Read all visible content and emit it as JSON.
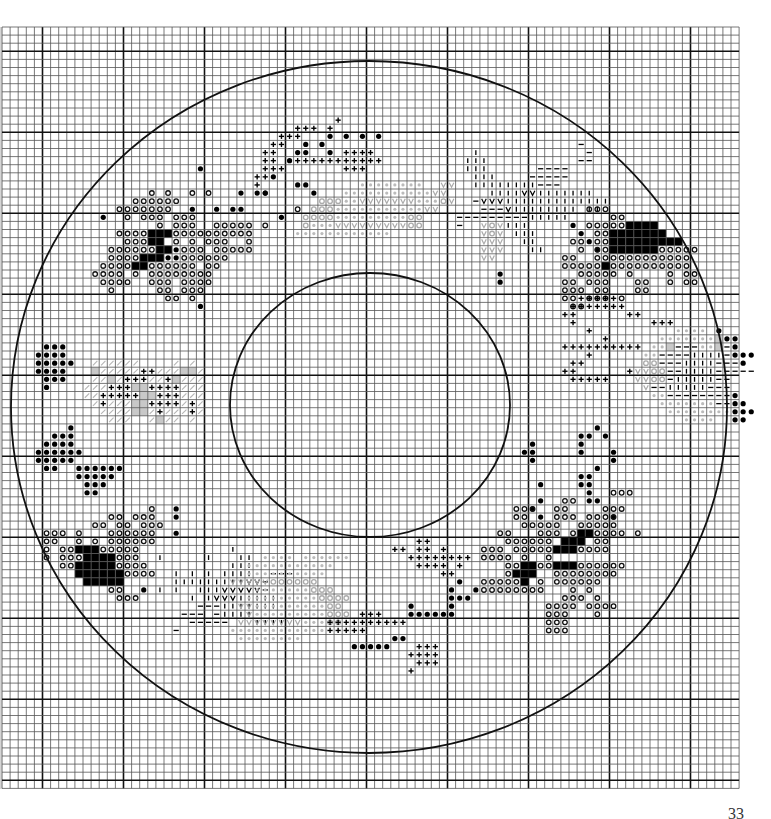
{
  "page": {
    "number": "33",
    "background": "#ffffff"
  },
  "grid": {
    "origin_x": 2,
    "origin_y": 27,
    "cell": 8.1,
    "cols": 91,
    "rows": 94,
    "heavy_every": 10,
    "heavy_offset_col": 4.5,
    "heavy_offset_row": 3,
    "line_color": "#555555",
    "heavy_color": "#111111"
  },
  "circles": {
    "outer": {
      "cx": 369,
      "cy": 407,
      "rx": 358,
      "ry": 346
    },
    "inner": {
      "cx": 370,
      "cy": 405,
      "rx": 140,
      "ry": 132
    }
  },
  "legend_symbols": {
    "o": "ring",
    "X": "solid",
    "b": "dot-large",
    ".": "dot-small",
    "+": "cross",
    "I": "bar-vertical",
    "-": "bar-horizontal",
    "V": "v-mark",
    "g": "grey-ring",
    "v": "grey-v",
    "s": "grey-slash",
    "k": "grey-dot",
    "q": "grey-fill"
  },
  "motifs": [
    {
      "name": "top-left-flower",
      "col": 10,
      "row": 17,
      "rows": [
        "..............b.................",
        ".......................b........",
        "..........................bb....",
        "........o.o..o.o...b.bb.....b...",
        "......oooooo.....................",
        "....ooooooo..b..b.bb......o.....",
        "..b..o.ooo.ooo..........b.......",
        ".........o.ooo..ooooo.o..........",
        "....ooooXXXoooooooooo...........",
        ".....oooXX.o.o.ooo..o...........",
        "...ooooooXXbooo.ooooo...........",
        "...ooooXXXbboooooo..............",
        "..ooooXXoooooo.oo...............",
        ".oooo.o.oooooooo................",
        "..oooo..ooo.oooo................",
        "...o.....oo.ooo.................",
        "..........oo.o..................",
        "..............b................."
      ]
    },
    {
      "name": "top-crosses",
      "col": 30,
      "row": 11,
      "rows": [
        "...........+.........",
        "......+++.+..........",
        "....+++...b.b.b.b....",
        "...++..b.b...........",
        "..++..bb..b.++++.....",
        "..++.b+++++++++++....",
        "..+++.......+++......",
        ".++..................",
        ".+...................",
        "..b.................."
      ]
    },
    {
      "name": "top-right-bars",
      "col": 56,
      "row": 14,
      "rows": [
        "...............-....",
        "..I.............-...",
        ".III...........--...",
        ".III......----......",
        "..III....-----.......",
        "..IIIIIIII---........",
        "....IIIIVVIIIIIII....",
        "..-VVVIIIIIIIIIIIII..",
        "...---VIIIIIIII.II...",
        "---------IIIII.......",
        "-.....III.....b......",
        ".......III.....b.....",
        "........II......b....",
        ".........II......b..."
      ]
    },
    {
      "name": "right-flower",
      "col": 69,
      "row": 22,
      "rows": [
        "...ooo............",
        "......oo..........",
        "...oooooXXXX......",
        "....ooXXXXXXX.....",
        ".oo.ooXXXXXXXXX...",
        "..o.ooXXXXXXooooo.",
        "oo..oooooooooooo..",
        "oooooXoooooooooo..",
        "..ooooo.o....o.oo.",
        "oo.ooo...oo..o.oo.",
        "ooo.oo...oo.......",
        "oo.ooo.o..........",
        ".oo..............."
      ]
    },
    {
      "name": "right-crosses",
      "col": 68,
      "row": 33,
      "rows": [
        "...+++++.......",
        "..+++++++......",
        ".++......++....",
        "..+.........+++",
        "....+..........",
        "......+........",
        ".++++++++++....",
        "....+..........",
        "..++...........",
        ".++......+.....",
        "..+++++........"
      ]
    },
    {
      "name": "right-grey-heart",
      "col": 77,
      "row": 37,
      "rows": [
        "......kkkk.b...",
        "....kkkkkkkqbb.",
        "...kkq---kkq-b.",
        "..kk----IIII-bbb",
        "..gg---IIII---b.",
        ".vvgg--IIII-----",
        ".vvgg-IIIII--...",
        "..v--IIIII---...",
        "...kk--------b..",
        "....kkkkkkk--bb.",
        ".....kkkkkkkkbbb",
        ".......kkkk..bb."
      ]
    },
    {
      "name": "lower-right-dots",
      "col": 62,
      "row": 49,
      "rows": [
        "...........b.....",
        ".........bb.b....",
        "...b.....b.......",
        "..bb.....b...b...",
        "...b.........b...",
        "...........b.....",
        ".........bb......",
        "....b....bb......",
        "..........b......",
        "....b.....bb.....",
        "...b.............",
        "....b........b..."
      ]
    },
    {
      "name": "lower-right-flower",
      "col": 59,
      "row": 57,
      "rows": [
        "................ooo",
        "..........oo......",
        "....ooo..oo....ooo..",
        "....oo...ooo.oooo...",
        ".....ooooo..ooooo...",
        "..oo...ooo.oXXoooo.o",
        "...oooooo.XXX.oo....",
        "ooo.oooooXXXoooo....",
        "oooo.o..o.........",
        "...ooXXooXXXoooooo..",
        "...oXXX..oooooooo...",
        "oooooX.o.oooooo.....",
        "oooooooo...o.o......",
        "..........ooo.o.....",
        "........oooo.oooo...",
        "........ooo...o.....",
        "........ooo.........",
        "........ooo........."
      ]
    },
    {
      "name": "left-heart-grey",
      "col": 9,
      "row": 41,
      "rows": [
        "..ssssss....s.s..",
        "..qsssss++sssqqs.",
        "..ssqs+++ss+qsss.",
        ".sss+++qq++++sss.",
        ".ss+++++qq+++sss.",
        "..s+sssqq++++s+s.",
        "...ssssqqs+sss+s.",
        "....sss..sqss.s.."
      ]
    },
    {
      "name": "left-dots",
      "col": 4,
      "row": 39,
      "rows": [
        ".bbb.......",
        "bbbb.......",
        "bbbbb......",
        "bbbb.......",
        ".bbb.......",
        ".b.........",
        "...........",
        "...........",
        "...........",
        "...........",
        "....b......",
        "..bbb......",
        ".bbbb......",
        "bbbbbb.....",
        "bbbbb......",
        ".bb..bbbbbb",
        ".....bbbbb.",
        "......bbb..",
        "......bb..."
      ]
    },
    {
      "name": "bottom-left-flower",
      "col": 5,
      "row": 59,
      "rows": [
        ".............o..b",
        "........oo.ooo..b",
        "......oo.oo.ooo..",
        "ooo.o...oooooo..b",
        "oo..o.o.oooooo...",
        "o.ooXXXooooo.....",
        "o.oooXXXXooo..I..",
        "..ooXXXXXoooo....",
        "....XXXXXXoooo...",
        ".....XXXXX.......",
        "........oo..b....",
        ".........ooo....."
      ]
    },
    {
      "name": "bottom-left-bars",
      "col": 18,
      "row": 64,
      "rows": [
        "..........I..........",
        ".......I...II........",
        "..........III........",
        "...I.I.I.IIII..---...",
        "...IIIIIIIIIVV-......",
        ".I.I..IIIVVVVV-......",
        ".....I.IVVVIIIII.....",
        "......---IIIIIII.....",
        "....---.-IIII........",
        ".....-----...IIII....",
        "...-................."
      ]
    },
    {
      "name": "bottom-grey-leaf",
      "col": 28,
      "row": 65,
      "rows": [
        "....kkkk.kkkkkk..........",
        "..kkkkkkkkkkk............",
        "..kkkkkkkkkk..............",
        "vvvvvgggggg..............",
        "...kkkkkkkggg............",
        "..kkkkkkkkkgggg..........",
        ".vvkkkkkkkkkgg...........",
        "..vkkkkkkkkkggg..........",
        ".vvvvvvvvkkkgg...........",
        "kkkkkkkkkkkk.............",
        ".kkkkkkkk................"
      ]
    },
    {
      "name": "bottom-crosses",
      "col": 40,
      "row": 63,
      "rows": [
        "...........++......",
        "........++.++.+....",
        "..........++++++++.",
        "...........++++.+..",
        "..............++...",
        "................b..",
        "...............b..b",
        "...............bbb.",
        "..........b....b...",
        "....+++...bbbbbb...",
        "++++++++++..........",
        "+++++...............",
        "........bb..........",
        "...bbbbb...+++......",
        "..........++++......",
        "...........+++......",
        "..........+........."
      ]
    },
    {
      "name": "top-grey-field",
      "col": 33,
      "row": 19,
      "rows": [
        "...........kkkkkkkk..vv",
        ".........kkkkkkkkkkkvv.",
        "......gggkkvvvvvvvkkkgv",
        ".....gggkkkkkkkkkkkvv..",
        "....ggggkkkkkkkkkgg....",
        "....gkkkvvvvvvvvvgg....",
        "...kkkkkkkkkkkk........"
      ]
    },
    {
      "name": "right-grey-column",
      "col": 59,
      "row": 24,
      "rows": [
        "vgv",
        "vgv",
        "vvv",
        "vvv",
        "vv.",
        "...",
        "..b",
        "..b"
      ]
    }
  ]
}
